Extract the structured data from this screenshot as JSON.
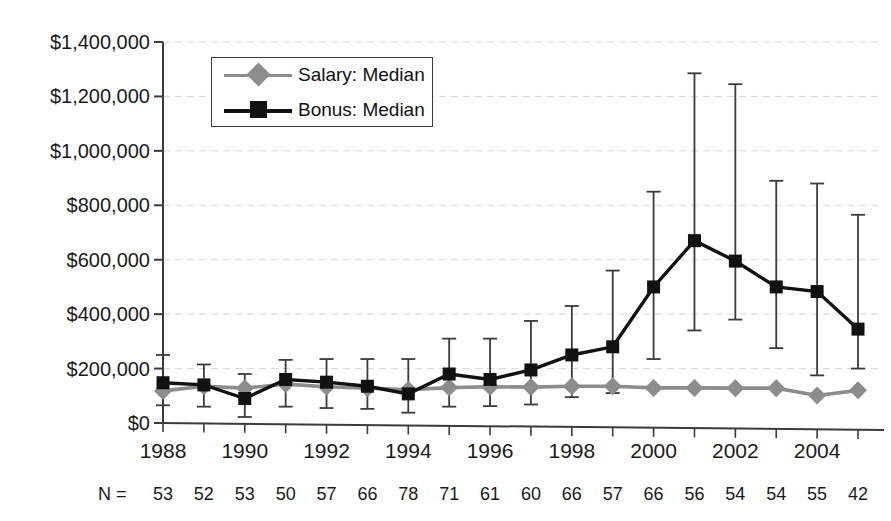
{
  "chart_data": {
    "type": "line",
    "title": "",
    "xlabel": "",
    "ylabel": "",
    "ylim": [
      0,
      1400000
    ],
    "xlim": [
      1988,
      2005
    ],
    "grid": true,
    "legend_position": "top-left-inside",
    "y_ticks": [
      0,
      200000,
      400000,
      600000,
      800000,
      1000000,
      1200000,
      1400000
    ],
    "y_tick_labels": [
      "$0",
      "$200,000",
      "$400,000",
      "$600,000",
      "$800,000",
      "$1,000,000",
      "$1,200,000",
      "$1,400,000"
    ],
    "x": [
      1988,
      1989,
      1990,
      1991,
      1992,
      1993,
      1994,
      1995,
      1996,
      1997,
      1998,
      1999,
      2000,
      2001,
      2002,
      2003,
      2004,
      2005
    ],
    "x_tick_labels": [
      "1988",
      "",
      "1990",
      "",
      "1992",
      "",
      "1994",
      "",
      "1996",
      "",
      "1998",
      "",
      "2000",
      "",
      "2002",
      "",
      "2004",
      ""
    ],
    "x_tick_labels_shown": [
      "1988",
      "1990",
      "1992",
      "1994",
      "1996",
      "1998",
      "2000",
      "2002",
      "2004"
    ],
    "series": [
      {
        "name": "Salary: Median",
        "marker": "diamond",
        "color": "#8c8c8c",
        "values": [
          118000,
          135000,
          128000,
          143000,
          133000,
          128000,
          122000,
          130000,
          133000,
          132000,
          135000,
          135000,
          129000,
          129000,
          128000,
          128000,
          101000,
          120000
        ]
      },
      {
        "name": "Bonus: Median",
        "marker": "square",
        "color": "#111111",
        "values": [
          148000,
          140000,
          90000,
          160000,
          150000,
          135000,
          107000,
          180000,
          160000,
          195000,
          250000,
          280000,
          500000,
          670000,
          595000,
          500000,
          483000,
          345000
        ],
        "error_low": [
          65000,
          60000,
          22000,
          60000,
          55000,
          52000,
          38000,
          60000,
          62000,
          68000,
          95000,
          110000,
          235000,
          340000,
          380000,
          275000,
          175000,
          200000
        ],
        "error_high": [
          250000,
          215000,
          180000,
          232000,
          235000,
          235000,
          235000,
          310000,
          310000,
          375000,
          430000,
          560000,
          850000,
          1285000,
          1245000,
          890000,
          880000,
          765000
        ]
      }
    ],
    "n_label": "N =",
    "n_values": [
      53,
      52,
      53,
      50,
      57,
      66,
      78,
      71,
      61,
      60,
      66,
      57,
      66,
      56,
      54,
      54,
      55,
      42
    ]
  },
  "legend": {
    "items": [
      {
        "label": "Salary: Median",
        "color": "#8c8c8c",
        "marker": "diamond"
      },
      {
        "label": "Bonus: Median",
        "color": "#111111",
        "marker": "square"
      }
    ]
  },
  "axis": {
    "line_color": "#3b3b3b",
    "grid_color": "#d7d7d7"
  }
}
